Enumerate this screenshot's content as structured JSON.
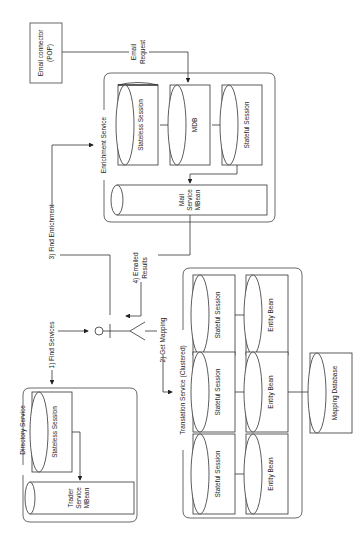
{
  "diagram": {
    "orientation": "rotated -90deg",
    "nodes": {
      "email_connector": {
        "line1": "Email connector",
        "line2": "(POP)"
      },
      "enrichment_service": {
        "title": "Enrichment Service",
        "stateless_session": "Stateless Session",
        "mdb": "MDB",
        "stateful_session": "Stateful Session",
        "mail_mbean": {
          "line1": "Mail",
          "line2": "Service",
          "line3": "MBean"
        }
      },
      "directory_service": {
        "title": "Directory Service",
        "stateless_session": "Stateless Session",
        "trader_mbean": {
          "line1": "Trader",
          "line2": "Service",
          "line3": "MBean"
        }
      },
      "translation_service": {
        "title": "Translation Service (Clustered)",
        "stateful_session": "Stateful Session",
        "entity_bean": "Entity Bean"
      },
      "mapping_database": "Mapping Database"
    },
    "edges": {
      "email_request": {
        "line1": "Email",
        "line2": "Request"
      },
      "find_services": "1) Find Services",
      "get_mapping": "2) Get Mapping",
      "find_enrichment": "3) Find Enrichment",
      "emailed_results": {
        "line1": "4) Emailed",
        "line2": "Results"
      }
    }
  }
}
